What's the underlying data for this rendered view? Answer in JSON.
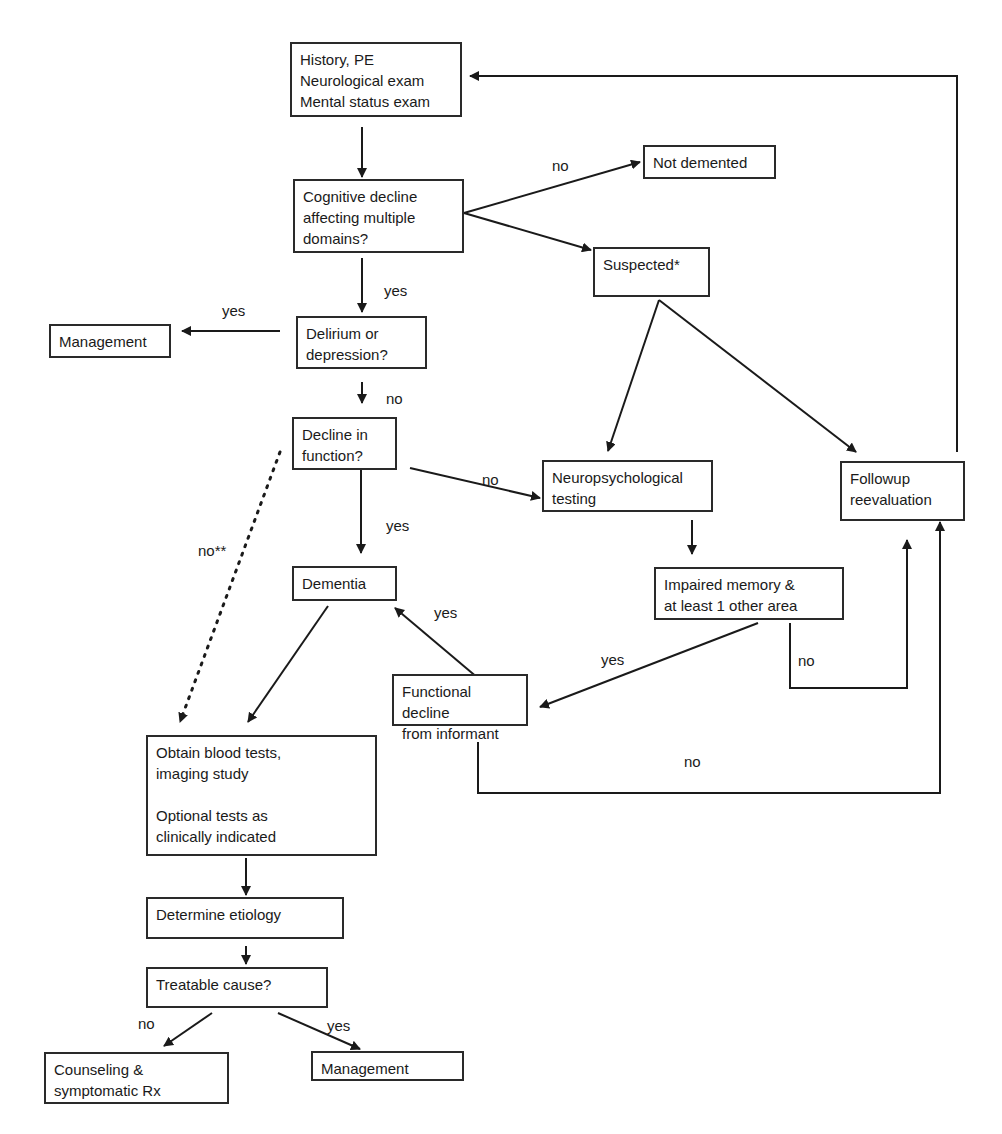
{
  "diagram": {
    "type": "flowchart",
    "nodes": {
      "history": "History, PE\nNeurological exam\nMental status exam",
      "cognitive": "Cognitive decline\naffecting multiple\ndomains?",
      "not_demented": "Not demented",
      "suspected": "Suspected*",
      "management_top": "Management",
      "delirium": "Delirium or\ndepression?",
      "decline_function": "Decline in\nfunction?",
      "neuropsych": "Neuropsychological\ntesting",
      "followup": "Followup\nreevaluation",
      "dementia": "Dementia",
      "impaired_memory": "Impaired memory &\nat least 1 other area",
      "functional_decline": "Functional decline\nfrom informant",
      "blood_tests": "Obtain blood tests,\nimaging study\n\nOptional tests as\nclinically indicated",
      "etiology": "Determine etiology",
      "treatable": "Treatable cause?",
      "counseling": "Counseling &\nsymptomatic Rx",
      "management_bottom": "Management"
    },
    "edge_labels": {
      "cognitive_no": "no",
      "cognitive_yes": "yes",
      "delirium_yes": "yes",
      "delirium_no": "no",
      "decline_no": "no",
      "decline_yes": "yes",
      "decline_no_dotted": "no**",
      "functional_yes": "yes",
      "impaired_yes": "yes",
      "impaired_no": "no",
      "functional_no": "no",
      "treatable_no": "no",
      "treatable_yes": "yes"
    },
    "colors": {
      "line": "#1a1a1a",
      "box_border": "#2a2a2a",
      "background": "#ffffff"
    }
  }
}
